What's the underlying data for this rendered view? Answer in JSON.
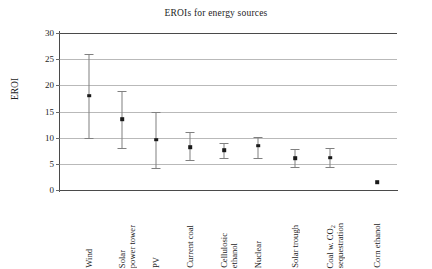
{
  "chart_data": {
    "type": "scatter",
    "title": "EROIs for energy sources",
    "xlabel": "",
    "ylabel": "EROI",
    "ylim": [
      0,
      30
    ],
    "yticks": [
      0,
      5,
      10,
      15,
      20,
      25,
      30
    ],
    "grid": true,
    "legend": "none",
    "error_bars": "vertical, capped",
    "categories": [
      "Wind",
      "Solar power tower",
      "PV",
      "Current coal",
      "Cellulosic ethanol",
      "Nuclear",
      "Solar trough",
      "Coal w. CO2 sequestration",
      "Corn ethanol"
    ],
    "values": [
      18.0,
      13.5,
      9.6,
      8.2,
      7.6,
      8.5,
      6.1,
      6.2,
      1.5
    ],
    "err_low": [
      10.0,
      8.0,
      4.2,
      5.7,
      6.2,
      6.2,
      4.4,
      4.4,
      null
    ],
    "err_high": [
      26.0,
      19.0,
      15.0,
      11.0,
      9.0,
      10.2,
      7.8,
      8.0,
      null
    ],
    "points": [
      {
        "label": "Wind",
        "label_lines": [
          "Wind"
        ],
        "value": 18.0,
        "low": 10.0,
        "high": 26.0,
        "x": 89
      },
      {
        "label": "Solar power tower",
        "label_lines": [
          "Solar",
          "power tower"
        ],
        "value": 13.5,
        "low": 8.0,
        "high": 19.0,
        "x": 122
      },
      {
        "label": "PV",
        "label_lines": [
          "PV"
        ],
        "value": 9.6,
        "low": 4.2,
        "high": 15.0,
        "x": 156
      },
      {
        "label": "Current coal",
        "label_lines": [
          "Current coal"
        ],
        "value": 8.2,
        "low": 5.7,
        "high": 11.0,
        "x": 190
      },
      {
        "label": "Cellulosic ethanol",
        "label_lines": [
          "Cellulosic",
          "ethanol"
        ],
        "value": 7.6,
        "low": 6.2,
        "high": 9.0,
        "x": 224
      },
      {
        "label": "Nuclear",
        "label_lines": [
          "Nuclear"
        ],
        "value": 8.5,
        "low": 6.2,
        "high": 10.2,
        "x": 258
      },
      {
        "label": "Solar trough",
        "label_lines": [
          "Solar trough"
        ],
        "value": 6.1,
        "low": 4.4,
        "high": 7.8,
        "x": 295
      },
      {
        "label": "Coal w. CO2 sequestration",
        "label_lines": [
          "Coal w. CO₂",
          "sequestration"
        ],
        "value": 6.2,
        "low": 4.4,
        "high": 8.0,
        "x": 330
      },
      {
        "label": "Corn ethanol",
        "label_lines": [
          "Corn ethanol"
        ],
        "value": 1.5,
        "low": null,
        "high": null,
        "x": 377
      }
    ]
  },
  "ytick_labels": [
    "0",
    "5",
    "10",
    "15",
    "20",
    "25",
    "30"
  ],
  "colors": {
    "marker": "#1a1a1a",
    "error_bar": "#808080",
    "grid": "#b9b9b9",
    "axis": "#4a4a4a",
    "text": "#1d1d1d",
    "background": "#ffffff"
  }
}
